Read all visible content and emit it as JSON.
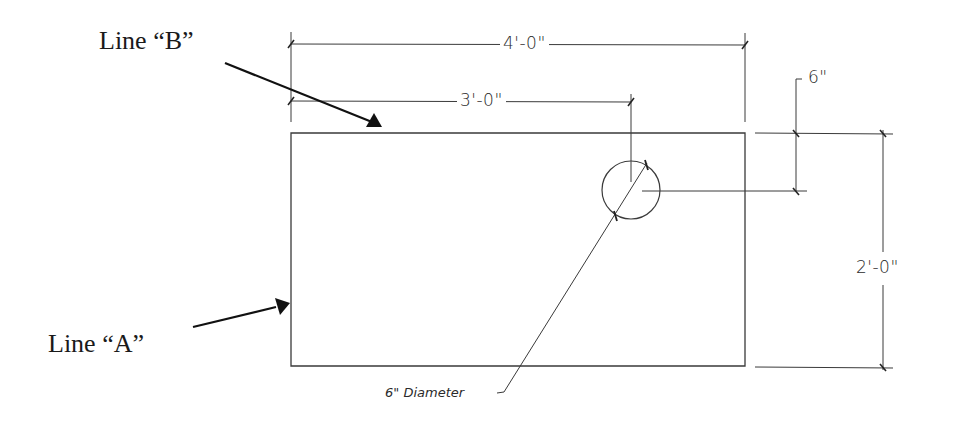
{
  "callouts": {
    "line_b": "Line “B”",
    "line_a": "Line “A”"
  },
  "dimensions": {
    "overall_width": "4'-0\"",
    "hole_offset_x": "3'-0\"",
    "hole_offset_y": "6\"",
    "overall_height": "2'-0\""
  },
  "notes": {
    "hole": "6\" Diameter"
  },
  "colors": {
    "ink": "#2b2b2b",
    "arrow": "#111111",
    "background": "#ffffff"
  }
}
